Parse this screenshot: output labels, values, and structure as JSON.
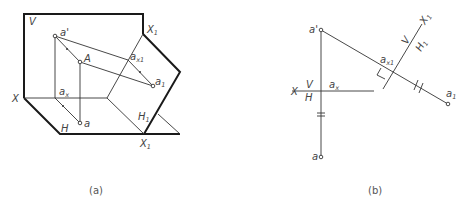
{
  "figure_a": {
    "caption": "(a)",
    "labels": {
      "V": "V",
      "X": "X",
      "H": "H",
      "X1_top": "X",
      "X1_top_sub": "1",
      "X1_bottom": "X",
      "X1_bottom_sub": "1",
      "H1": "H",
      "H1_sub": "1",
      "a_prime": "a'",
      "A": "A",
      "a": "a",
      "a1": "a",
      "a1_sub": "1",
      "ax": "a",
      "ax_sub": "x",
      "ax1": "a",
      "ax1_sub": "x1"
    }
  },
  "figure_b": {
    "caption": "(b)",
    "labels": {
      "X": "X",
      "V": "V",
      "H": "H",
      "ax": "a",
      "ax_sub": "x",
      "a_prime": "a'",
      "a": "a",
      "ax1": "a",
      "ax1_sub": "x1",
      "a1": "a",
      "a1_sub": "1",
      "V_aux": "V",
      "H1": "H",
      "H1_sub": "1",
      "X1": "X",
      "X1_sub": "1"
    }
  }
}
